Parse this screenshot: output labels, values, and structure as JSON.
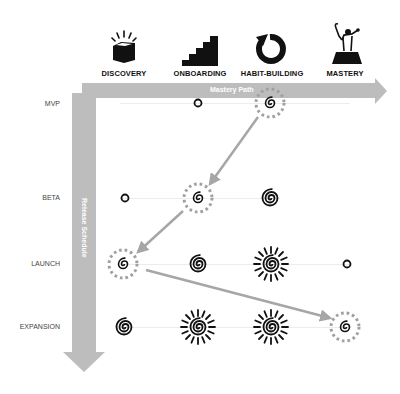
{
  "stages": [
    {
      "label": "DISCOVERY",
      "icon": "open-box-icon"
    },
    {
      "label": "ONBOARDING",
      "icon": "staircase-icon"
    },
    {
      "label": "HABIT-BUILDING",
      "icon": "cycle-arrow-icon"
    },
    {
      "label": "MASTERY",
      "icon": "summit-figure-icon"
    }
  ],
  "axes": {
    "horizontal": "Mastery Path",
    "vertical": "Release Schedule",
    "color": "#bdbdbd"
  },
  "releases": [
    {
      "label": "MVP",
      "cells": [
        "empty",
        "dot",
        "spiral-small",
        "empty"
      ],
      "highlight": 2
    },
    {
      "label": "BETA",
      "cells": [
        "dot",
        "spiral-small",
        "spiral-large",
        "empty"
      ],
      "highlight": 1
    },
    {
      "label": "LAUNCH",
      "cells": [
        "spiral-small",
        "spiral-large",
        "sun-spiral",
        "dot"
      ],
      "highlight": 0
    },
    {
      "label": "EXPANSION",
      "cells": [
        "spiral-large",
        "sun-spiral",
        "sun-spiral",
        "spiral-small"
      ],
      "highlight": 3
    }
  ],
  "path_arrows": [
    {
      "from": "MVP/HABIT-BUILDING",
      "to": "BETA/ONBOARDING"
    },
    {
      "from": "BETA/ONBOARDING",
      "to": "LAUNCH/DISCOVERY"
    },
    {
      "from": "LAUNCH/DISCOVERY",
      "to": "EXPANSION/MASTERY"
    }
  ],
  "colors": {
    "icon": "#111111",
    "arrow": "#a6a6a6",
    "highlight_ring": "#a0a0a0"
  }
}
